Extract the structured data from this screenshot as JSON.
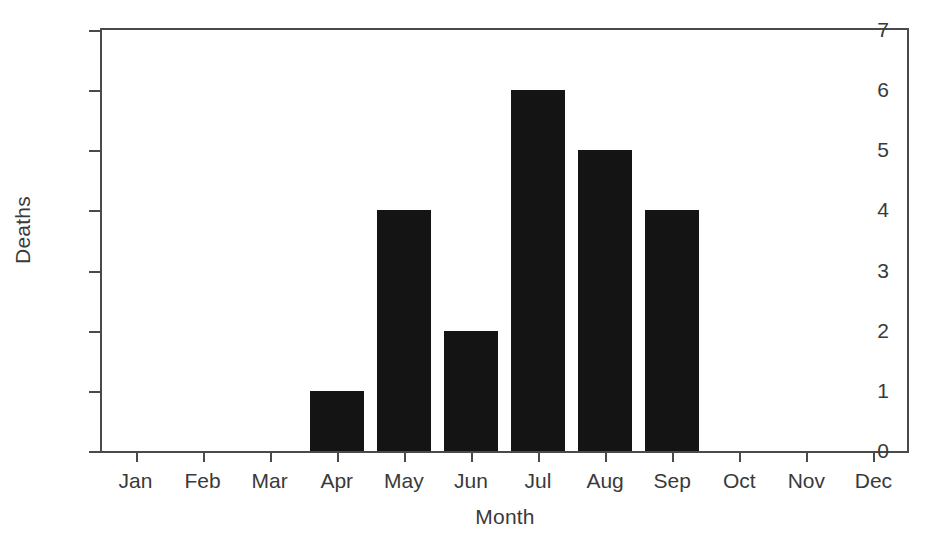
{
  "chart_data": {
    "type": "bar",
    "title": "",
    "subtitle": "",
    "xlabel": "Month",
    "ylabel": "Deaths",
    "categories": [
      "Jan",
      "Feb",
      "Mar",
      "Apr",
      "May",
      "Jun",
      "Jul",
      "Aug",
      "Sep",
      "Oct",
      "Nov",
      "Dec"
    ],
    "values": [
      0,
      0,
      0,
      1,
      4,
      2,
      6,
      5,
      4,
      0,
      0,
      0
    ],
    "ylim": [
      0,
      7
    ],
    "ytick_labels": [
      "0",
      "1",
      "2",
      "3",
      "4",
      "5",
      "6",
      "7"
    ],
    "ytick_values": [
      0,
      1,
      2,
      3,
      4,
      5,
      6,
      7
    ],
    "grid": false,
    "legend": null,
    "legend_position": "none",
    "bar_color": "#141414",
    "axis_color": "#4a4a4a",
    "text_color": "#3a3a3a",
    "background_color": "#ffffff",
    "annotations": []
  }
}
